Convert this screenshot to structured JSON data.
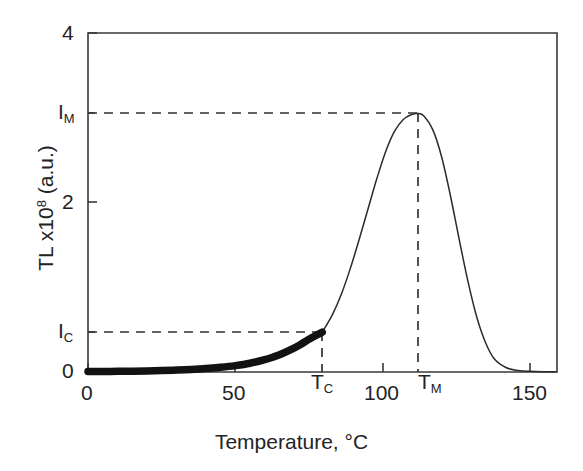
{
  "chart_data": {
    "type": "line",
    "title": "",
    "xlabel": "Temperature, °C",
    "ylabel": "TL x10⁸ (a.u.)",
    "ylabel_base": "TL x10",
    "ylabel_exponent": "8",
    "ylabel_units": " (a.u.)",
    "xlim": [
      0,
      159
    ],
    "ylim": [
      0,
      4
    ],
    "grid": false,
    "legend": null,
    "x_tick_values": [
      0,
      50,
      100,
      150
    ],
    "x_tick_labels": [
      "0",
      "50",
      "100",
      "150"
    ],
    "y_tick_values": [
      0,
      2,
      4
    ],
    "y_tick_labels": [
      "0",
      "2",
      "4"
    ],
    "special_x_ticks": [
      {
        "label": "T",
        "sub": "C",
        "value": 79.5
      },
      {
        "label": "T",
        "sub": "M",
        "value": 112
      }
    ],
    "special_y_ticks": [
      {
        "label": "I",
        "sub": "C",
        "value": 0.47
      },
      {
        "label": "I",
        "sub": "M",
        "value": 3.05
      }
    ],
    "annotations": [
      {
        "name": "Ic-horizontal-dashed",
        "from": [
          0,
          0.47
        ],
        "to": [
          79.5,
          0.47
        ]
      },
      {
        "name": "Tc-vertical-dashed",
        "from": [
          79.5,
          0
        ],
        "to": [
          79.5,
          0.47
        ]
      },
      {
        "name": "Im-horizontal-dashed",
        "from": [
          0,
          3.05
        ],
        "to": [
          112,
          3.05
        ]
      },
      {
        "name": "Tm-vertical-dashed",
        "from": [
          112,
          0
        ],
        "to": [
          112,
          3.05
        ]
      }
    ],
    "series": [
      {
        "name": "glow-curve-measured",
        "style": "thick",
        "description": "Bold segment of the thermoluminescence glow curve from 0 °C up to the cut-off temperature T_C where the intensity equals I_C",
        "x": [
          0,
          5,
          10,
          15,
          20,
          25,
          30,
          35,
          40,
          45,
          50,
          55,
          60,
          63,
          66,
          69,
          72,
          75,
          77,
          79.5
        ],
        "y": [
          0.005,
          0.006,
          0.008,
          0.01,
          0.013,
          0.017,
          0.023,
          0.03,
          0.04,
          0.055,
          0.075,
          0.103,
          0.145,
          0.178,
          0.218,
          0.266,
          0.322,
          0.386,
          0.425,
          0.47
        ]
      },
      {
        "name": "glow-curve-extrapolated",
        "style": "thin",
        "description": "Thin continuation of the glow curve beyond T_C, rising to the maximum intensity I_M at T_M and decaying back to baseline",
        "x": [
          79.5,
          83,
          86,
          89,
          92,
          95,
          98,
          101,
          104,
          107,
          110,
          112,
          114,
          117,
          120,
          123,
          126,
          129,
          132,
          135,
          138,
          142,
          146,
          150,
          155,
          159
        ],
        "y": [
          0.47,
          0.68,
          0.92,
          1.22,
          1.56,
          1.92,
          2.28,
          2.6,
          2.84,
          2.98,
          3.04,
          3.05,
          3.02,
          2.86,
          2.54,
          2.08,
          1.56,
          1.06,
          0.64,
          0.34,
          0.15,
          0.05,
          0.018,
          0.008,
          0.004,
          0.003
        ]
      }
    ],
    "colors": {
      "axis": "#3a3a3a",
      "curve": "#2b2b2b",
      "curve_thick": "#121212",
      "dashed": "#333333",
      "background": "#ffffff",
      "text": "#232323"
    }
  },
  "axis_labels": {
    "y_4": "4",
    "y_2": "2",
    "y_0": "0",
    "y_Im_main": "I",
    "y_Im_sub": "M",
    "y_Ic_main": "I",
    "y_Ic_sub": "C",
    "x_0": "0",
    "x_50": "50",
    "x_100": "100",
    "x_150": "150",
    "x_Tc_main": "T",
    "x_Tc_sub": "C",
    "x_Tm_main": "T",
    "x_Tm_sub": "M"
  },
  "titles": {
    "x_axis": "Temperature, °C",
    "y_axis_base": "TL x10",
    "y_axis_exp": "8",
    "y_axis_tail": " (a.u.)"
  }
}
